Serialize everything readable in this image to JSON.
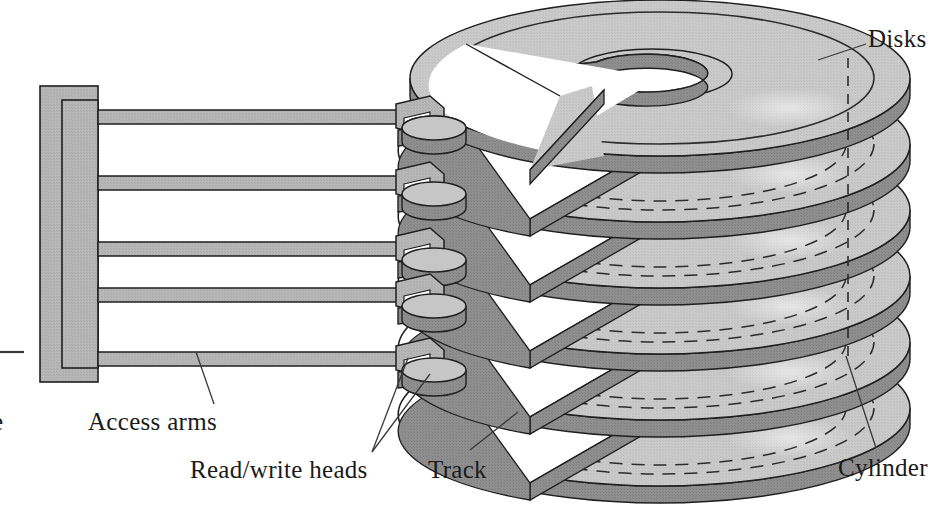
{
  "figure": {
    "background_color": "#ffffff"
  },
  "labels": {
    "disks": "Disks",
    "access_arms": "Access arms",
    "read_write_heads": "Read/write heads",
    "track": "Track",
    "cylinder": "Cylinder",
    "partial_left": "e"
  },
  "colors": {
    "disk_top": "#c9c9c9",
    "disk_top_light": "#d2d2d2",
    "disk_edge": "#8d8d8d",
    "disk_edge_dark": "#7b7b7b",
    "arm_fill": "#b4b4b4",
    "arm_fill_light": "#bfbfbf",
    "head_fill": "#a8a8a8",
    "head_top": "#c0c0c0",
    "head_dark": "#8a8a8a",
    "actuator_fill": "#b6b6b6",
    "outline": "#1f1f1f",
    "leader": "#3a3a3a",
    "text": "#1a1a1a"
  },
  "structure": {
    "disk_count": 6,
    "arm_count": 5,
    "head_count": 5,
    "track_rings_per_disk": 2,
    "cylinder_line": "vertical-dashed",
    "disk_notch": "pie-wedge-cutout",
    "top_disk_hub": "spiral-cutaway-hub-hole"
  },
  "geometry": {
    "disk_center_x": 660,
    "disk_rx": 250,
    "disk_ry": 78,
    "disk_thickness": 17,
    "disk_top_y": 78,
    "disk_pitch": 66,
    "cylinder_dash_x": 848,
    "actuator_x": 40,
    "actuator_y": 86,
    "actuator_w": 58,
    "actuator_h": 296,
    "arm_right_x": 400,
    "arm_height": 14,
    "arm_ys": [
      110,
      176,
      242,
      308,
      352
    ]
  },
  "leaders": [
    {
      "name": "disks-leader",
      "from": [
        866,
        44
      ],
      "to": [
        820,
        58
      ]
    },
    {
      "name": "access-arms-leader",
      "from": [
        214,
        404
      ],
      "to": [
        196,
        352
      ]
    },
    {
      "name": "rw-heads-leader-a",
      "from": [
        370,
        452
      ],
      "to": [
        425,
        372
      ]
    },
    {
      "name": "rw-heads-leader-b",
      "from": [
        370,
        452
      ],
      "to": [
        409,
        360
      ]
    },
    {
      "name": "track-leader",
      "from": [
        470,
        452
      ],
      "to": [
        516,
        414
      ]
    },
    {
      "name": "cylinder-leader",
      "from": [
        876,
        448
      ],
      "to": [
        846,
        358
      ]
    },
    {
      "name": "partial-left-dash",
      "from": [
        0,
        352
      ],
      "to": [
        22,
        352
      ]
    }
  ]
}
